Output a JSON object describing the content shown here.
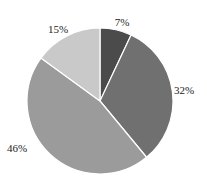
{
  "chart_data": {
    "type": "pie",
    "title": "",
    "start_angle_deg": 0,
    "direction": "clockwise",
    "categories": [
      "Slice A",
      "Slice B",
      "Slice C",
      "Slice D"
    ],
    "values": [
      7,
      32,
      46,
      15
    ],
    "labels": [
      "7%",
      "32%",
      "46%",
      "15%"
    ],
    "colors": [
      "#4b4b4b",
      "#707070",
      "#9b9b9b",
      "#c9c9c9"
    ],
    "legend": "none",
    "separator_color": "#ffffff"
  },
  "layout": {
    "center_x": 100,
    "center_y": 101,
    "radius": 73,
    "label_positions": [
      {
        "x": 122,
        "y": 22
      },
      {
        "x": 184,
        "y": 90
      },
      {
        "x": 17,
        "y": 148
      },
      {
        "x": 58,
        "y": 29
      }
    ]
  }
}
